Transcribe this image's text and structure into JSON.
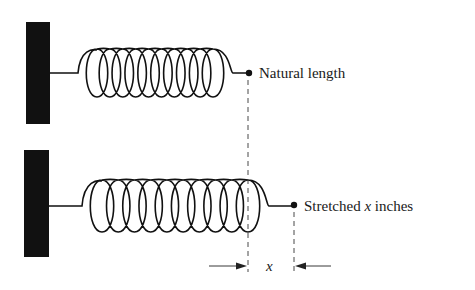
{
  "diagram": {
    "type": "spring-stretch-illustration",
    "colors": {
      "ink": "#111111",
      "text": "#1a1a1a",
      "background": "#ffffff"
    },
    "springs": [
      {
        "id": "natural",
        "label": "Natural length",
        "coils": 10,
        "state": "compressed"
      },
      {
        "id": "stretched",
        "label_prefix": "Stretched ",
        "label_var": "x",
        "label_suffix": " inches",
        "coils": 10,
        "state": "stretched"
      }
    ],
    "dimension": {
      "label": "x"
    },
    "icons": [
      "wall-icon",
      "spring-icon",
      "endpoint-dot-icon",
      "arrow-right-icon",
      "arrow-left-icon"
    ]
  }
}
